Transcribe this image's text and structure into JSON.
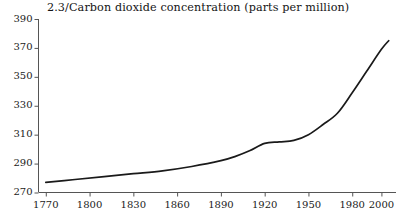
{
  "chart_data": {
    "type": "line",
    "title": "2.3/Carbon dioxide concentration (parts per million)",
    "xlabel": "",
    "ylabel": "",
    "xlim": [
      1765,
      2010
    ],
    "ylim": [
      270,
      390
    ],
    "grid": false,
    "legend": "none",
    "line_color": "#1a1a1a",
    "xticks": [
      1770,
      1800,
      1830,
      1860,
      1890,
      1920,
      1950,
      1980,
      2000
    ],
    "xtick_labels": [
      "1770",
      "1800",
      "1830",
      "1860",
      "1890",
      "1920",
      "1950",
      "1980",
      "2000"
    ],
    "yticks": [
      270,
      290,
      310,
      330,
      350,
      370,
      390
    ],
    "ytick_labels": [
      "270",
      "290",
      "310",
      "330",
      "350",
      "370",
      "390"
    ],
    "series": [
      {
        "name": "Carbon dioxide concentration",
        "x": [
          1770,
          1790,
          1810,
          1830,
          1850,
          1870,
          1890,
          1900,
          1910,
          1920,
          1930,
          1940,
          1950,
          1960,
          1970,
          1980,
          1990,
          2000,
          2005
        ],
        "values": [
          277,
          279,
          281,
          283,
          285,
          288,
          292,
          295,
          299,
          304,
          305,
          306,
          310,
          317,
          325,
          339,
          354,
          369,
          375
        ]
      }
    ]
  }
}
